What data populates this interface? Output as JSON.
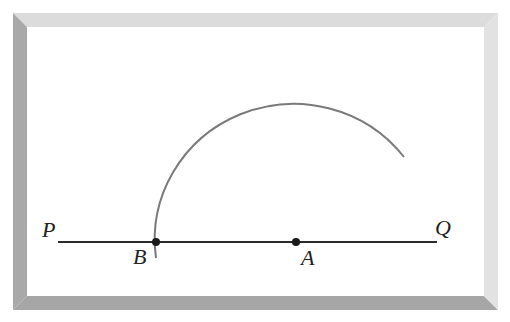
{
  "diagram": {
    "type": "geometric-construction",
    "frame": {
      "top_color": "#dcdcdc",
      "left_color": "#a9a9a9",
      "bottom_color": "#a6a6a6",
      "right_color": "#e2e2e2",
      "inner_color": "#ffffff"
    },
    "line": {
      "start_label": "P",
      "end_label": "Q",
      "color": "#2a2a2a"
    },
    "points": [
      {
        "id": "B",
        "label": "B"
      },
      {
        "id": "A",
        "label": "A"
      }
    ],
    "arc": {
      "center": "A",
      "through": "B",
      "color": "#777777"
    },
    "colors": {
      "line": "#2a2a2a",
      "arc": "#7a7a7a",
      "text": "#222222"
    }
  }
}
